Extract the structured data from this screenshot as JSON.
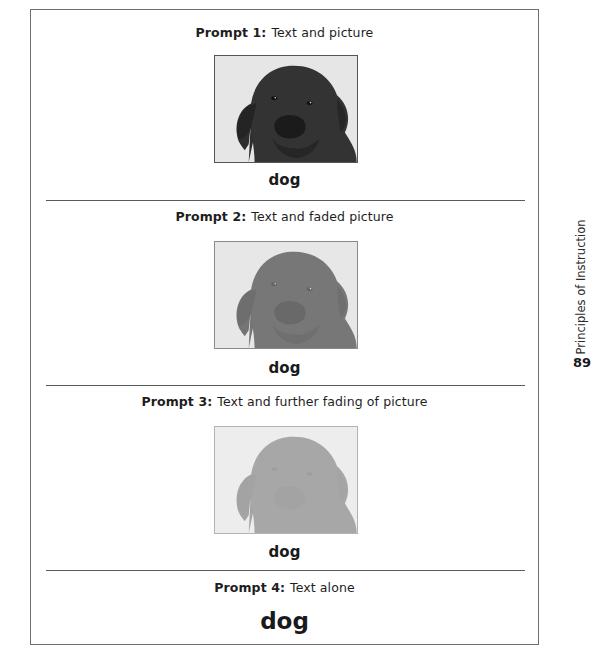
{
  "page": {
    "side_title": "Principles of Instruction",
    "page_number": "89"
  },
  "prompts": [
    {
      "label": "Prompt 1:",
      "description": "Text and picture",
      "picture": "dog-photo",
      "picture_fade": "none",
      "word": "dog"
    },
    {
      "label": "Prompt 2:",
      "description": "Text and faded picture",
      "picture": "dog-photo",
      "picture_fade": "faded",
      "word": "dog"
    },
    {
      "label": "Prompt 3:",
      "description": "Text and further fading of picture",
      "picture": "dog-photo",
      "picture_fade": "further-faded",
      "word": "dog"
    },
    {
      "label": "Prompt 4:",
      "description": "Text alone",
      "word": "dog"
    }
  ],
  "colors": {
    "frame_border": "#6e6e6e",
    "text": "#1e1e1e",
    "divider": "#5a5a5a"
  }
}
